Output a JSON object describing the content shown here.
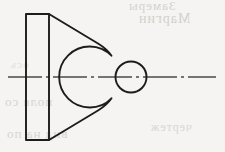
{
  "drawing": {
    "title": "Orthographic Front View - Tapered Bracket with Circular Boss",
    "discipline": "Mechanical Engineering Drawing",
    "projection": "Front view, symmetric about horizontal axis",
    "paper_color": "#f5f4f2",
    "line_color": "#1c1c1c",
    "centerline_color": "#4a4a4a",
    "canvas": {
      "width": 225,
      "height": 152
    },
    "geometry": {
      "axis_y": 77,
      "flange": {
        "name": "rectangular mounting flange",
        "left_x": 26,
        "right_x": 49,
        "top_y": 14,
        "bottom_y": 140,
        "width": 23,
        "height": 126
      },
      "taper_arm": {
        "name": "tapered web arm",
        "upper_start": {
          "x": 49,
          "y": 14
        },
        "upper_end": {
          "x": 107,
          "y": 49
        },
        "lower_start": {
          "x": 49,
          "y": 140
        },
        "lower_end": {
          "x": 107,
          "y": 105
        },
        "fillet_radius": 9
      },
      "boss_outer_circle": {
        "name": "boss outside diameter",
        "center_x": 131,
        "center_y": 77,
        "radius": 30.5
      },
      "boss_inner_circle": {
        "name": "bore diameter",
        "center_x": 131,
        "center_y": 77,
        "radius": 15.5
      },
      "centerline": {
        "start_x": 8,
        "end_x": 216,
        "pattern": "long-dash dot"
      }
    }
  },
  "artifacts": {
    "note": "faint mirrored show-through text from reverse of page",
    "ghosts": [
      "Замеры",
      "Маргин",
      "поля со",
      "вид на по",
      "чертеж",
      "ось"
    ]
  }
}
